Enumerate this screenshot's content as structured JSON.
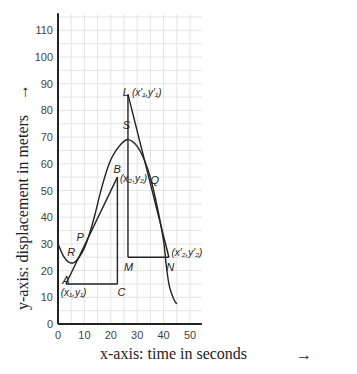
{
  "chart_data": {
    "type": "line",
    "title": "",
    "xlabel": "x-axis: time in seconds",
    "ylabel": "y-axis: displacement in meters",
    "xlim": [
      0,
      54.5
    ],
    "ylim": [
      0,
      116
    ],
    "grid": true,
    "x_ticks": [
      0,
      10,
      20,
      30,
      40,
      50
    ],
    "y_ticks": [
      0,
      10,
      20,
      30,
      40,
      50,
      60,
      70,
      80,
      90,
      100,
      110
    ],
    "curve": {
      "name": "displacement-time curve",
      "points": [
        [
          0,
          30
        ],
        [
          2,
          25.5
        ],
        [
          4,
          23.2
        ],
        [
          6,
          23
        ],
        [
          8,
          25
        ],
        [
          10,
          28.5
        ],
        [
          12,
          34
        ],
        [
          14,
          41
        ],
        [
          16,
          49
        ],
        [
          18,
          56
        ],
        [
          20,
          61.5
        ],
        [
          22,
          65
        ],
        [
          24,
          67.5
        ],
        [
          26,
          69
        ],
        [
          28,
          68.5
        ],
        [
          30,
          66.5
        ],
        [
          32,
          63
        ],
        [
          34,
          58
        ],
        [
          36,
          51
        ],
        [
          38,
          42
        ],
        [
          40,
          31
        ],
        [
          41,
          22
        ],
        [
          42,
          15
        ],
        [
          43,
          11.5
        ],
        [
          44,
          9
        ],
        [
          45,
          7.5
        ]
      ]
    },
    "tangent_lines": [
      {
        "name": "secant-AB",
        "from": [
          3,
          15
        ],
        "to": [
          22.5,
          55
        ]
      },
      {
        "name": "tangent-LN",
        "from": [
          26.5,
          86
        ],
        "to": [
          42,
          25
        ]
      }
    ],
    "triangle_legs": [
      {
        "name": "leg-AC",
        "from": [
          3,
          15
        ],
        "to": [
          22.5,
          15
        ]
      },
      {
        "name": "leg-CB",
        "from": [
          22.5,
          15
        ],
        "to": [
          22.5,
          55
        ]
      },
      {
        "name": "leg-LM",
        "from": [
          26.5,
          86
        ],
        "to": [
          26.5,
          25
        ]
      },
      {
        "name": "leg-MN",
        "from": [
          26.5,
          25
        ],
        "to": [
          42,
          25
        ]
      }
    ],
    "annotations": [
      {
        "id": "A",
        "text": "A",
        "at": [
          1.6,
          15
        ]
      },
      {
        "id": "A-coord",
        "text": "(x₁,y₁)",
        "at": [
          1,
          10.5
        ]
      },
      {
        "id": "B",
        "text": "B",
        "at": [
          21,
          56.5
        ]
      },
      {
        "id": "B-coord",
        "text": "(x₂,y₂)",
        "at": [
          23.5,
          53
        ]
      },
      {
        "id": "C",
        "text": "C",
        "at": [
          22.5,
          10.5
        ]
      },
      {
        "id": "P",
        "text": "P",
        "at": [
          7,
          31
        ]
      },
      {
        "id": "R",
        "text": "R",
        "at": [
          3.5,
          25.5
        ]
      },
      {
        "id": "S",
        "text": "S",
        "at": [
          24.5,
          73
        ]
      },
      {
        "id": "L",
        "text": "L",
        "at": [
          24.5,
          85.5
        ]
      },
      {
        "id": "L-coord",
        "text": "(x'₁,y'₁)",
        "at": [
          28,
          85.5
        ]
      },
      {
        "id": "M",
        "text": "M",
        "at": [
          25,
          20
        ]
      },
      {
        "id": "N",
        "text": "N",
        "at": [
          41,
          20
        ]
      },
      {
        "id": "N-coord",
        "text": "(x'₂,y'₂)",
        "at": [
          43,
          25.5
        ]
      },
      {
        "id": "Q",
        "text": "Q",
        "at": [
          35,
          52.5
        ]
      }
    ],
    "arrows": {
      "x": "→",
      "y": "→"
    }
  },
  "colors": {
    "line": "#222222",
    "grid": "#e3e3e3",
    "axis": "#222222"
  }
}
